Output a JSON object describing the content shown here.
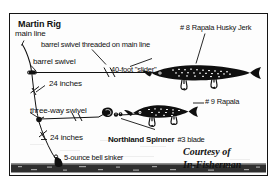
{
  "figure": {
    "kind": "fishing-rig-diagram",
    "title": "Martin Rig",
    "credit_line_1": "Courtesy of",
    "credit_line_2": "In-Fisherman",
    "colors": {
      "ink": "#111111",
      "paper": "#fdfdfd",
      "frame": "#141414",
      "bottom_substrate": "#2a2a2a"
    }
  },
  "labels": {
    "title": "Martin Rig",
    "main_line": "main line",
    "barrel_swivel_threaded": "barrel swivel threaded on main line",
    "barrel_swivel": "barrel swivel",
    "leader_top": "24 inches",
    "slider": "40-foot \"slider\"",
    "husky_jerk": "# 8 Rapala Husky Jerk",
    "rapala_9": "# 9 Rapala",
    "three_way_swivel": "three-way swivel",
    "leader_bottom": "24 inches",
    "bell_sinker": "5-ounce bell sinker",
    "spinner_brand": "Northland Spinner",
    "spinner_blade": "#3 blade"
  },
  "components": [
    {
      "name": "main-line",
      "label": "main line"
    },
    {
      "name": "barrel-swivel-threaded",
      "label": "barrel swivel threaded on main line"
    },
    {
      "name": "barrel-swivel",
      "label": "barrel swivel"
    },
    {
      "name": "leader-24-inches-upper",
      "label": "24 inches"
    },
    {
      "name": "slider-40-foot",
      "label": "40-foot \"slider\""
    },
    {
      "name": "lure-rapala-husky-jerk-8",
      "label": "# 8 Rapala Husky Jerk"
    },
    {
      "name": "lure-rapala-9",
      "label": "# 9 Rapala"
    },
    {
      "name": "three-way-swivel",
      "label": "three-way swivel"
    },
    {
      "name": "leader-24-inches-lower",
      "label": "24 inches"
    },
    {
      "name": "bell-sinker-5-ounce",
      "label": "5-ounce bell sinker"
    },
    {
      "name": "northland-spinner-3-blade",
      "label": "Northland Spinner #3 blade"
    }
  ]
}
